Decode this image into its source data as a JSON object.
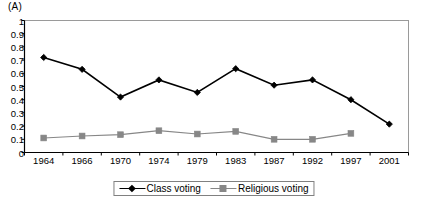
{
  "panel": {
    "label": "(A)"
  },
  "chart_data": {
    "type": "line",
    "title": "",
    "subtitle": "",
    "xlabel": "",
    "ylabel": "",
    "categories": [
      "1964",
      "1966",
      "1970",
      "1974",
      "1979",
      "1983",
      "1987",
      "1992",
      "1997",
      "2001"
    ],
    "ylim": [
      0,
      1
    ],
    "ytick_labels": [
      "0",
      "0.1",
      "0.2",
      "0.3",
      "0.4",
      "0.5",
      "0.6",
      "0.7",
      "0.8",
      "0.9",
      "1"
    ],
    "ytick_values": [
      0,
      0.1,
      0.2,
      0.3,
      0.4,
      0.5,
      0.6,
      0.7,
      0.8,
      0.9,
      1
    ],
    "grid": false,
    "legend_position": "bottom-center",
    "series": [
      {
        "name": "Class voting",
        "color": "#000000",
        "marker": "diamond",
        "values": [
          0.72,
          0.63,
          0.42,
          0.55,
          0.455,
          0.635,
          0.51,
          0.55,
          0.4,
          0.215
        ]
      },
      {
        "name": "Religious voting",
        "color": "#878787",
        "marker": "square",
        "values": [
          0.11,
          0.125,
          0.135,
          0.165,
          0.14,
          0.16,
          0.1,
          0.1,
          0.145,
          null
        ]
      }
    ]
  },
  "legend": {
    "items": [
      {
        "label": "Class voting"
      },
      {
        "label": "Religious voting"
      }
    ]
  },
  "colors": {
    "class_voting": "#000000",
    "religious_voting": "#878787",
    "plot_border": "#9a9a9a",
    "axis": "#000000"
  }
}
